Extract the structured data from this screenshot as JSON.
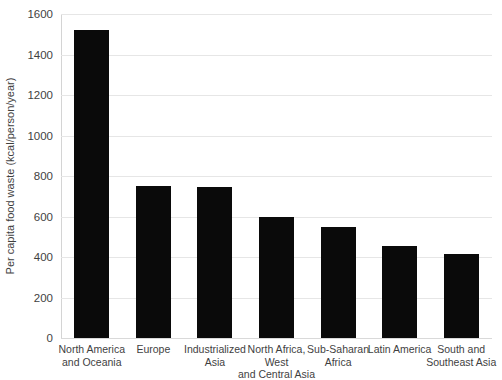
{
  "chart_data": {
    "type": "bar",
    "title": "",
    "xlabel": "",
    "ylabel": "Per capita food waste (kcal/person/year)",
    "ylim": [
      0,
      1600
    ],
    "yticks": [
      0,
      200,
      400,
      600,
      800,
      1000,
      1200,
      1400,
      1600
    ],
    "ytick_labels": [
      "0",
      "200",
      "400",
      "600",
      "800",
      "1000",
      "1200",
      "1400",
      "1600"
    ],
    "grid": true,
    "legend": "none",
    "bar_color": "#0a0a0a",
    "gridline_color": "#e6e6e6",
    "categories": [
      "North America\nand Oceania",
      "Europe",
      "Industrialized\nAsia",
      "North Africa,\nWest\nand Central Asia",
      "Sub-Saharan\nAfrica",
      "Latin America",
      "South and\nSoutheast Asia"
    ],
    "values": [
      1520,
      750,
      748,
      600,
      550,
      455,
      415
    ]
  }
}
